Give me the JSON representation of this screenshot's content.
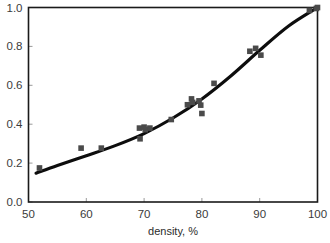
{
  "chart_data": {
    "type": "scatter",
    "title": "",
    "subtitle": "",
    "xlabel": "density, %",
    "ylabel": "",
    "xlim": [
      50,
      100
    ],
    "ylim": [
      0.0,
      1.0
    ],
    "xticks": [
      50,
      60,
      70,
      80,
      90,
      100
    ],
    "xtick_labels": [
      "50",
      "60",
      "70",
      "80",
      "90",
      "100"
    ],
    "yticks": [
      0.0,
      0.2,
      0.4,
      0.6,
      0.8,
      1.0
    ],
    "ytick_labels": [
      "0.0",
      "0.2",
      "0.4",
      "0.6",
      "0.8",
      "1.0"
    ],
    "grid": false,
    "legend": false,
    "legend_position": "none",
    "marker_style": "filled-square",
    "marker_color": "#4a4a4a",
    "line_color": "#0d0d0d",
    "frame_color": "#1a1a1a",
    "series": [
      {
        "name": "measured points",
        "type": "scatter",
        "points": [
          [
            51.9,
            0.175
          ],
          [
            59.1,
            0.277
          ],
          [
            62.6,
            0.277
          ],
          [
            69.2,
            0.38
          ],
          [
            69.3,
            0.325
          ],
          [
            70.0,
            0.385
          ],
          [
            70.2,
            0.372
          ],
          [
            71.0,
            0.38
          ],
          [
            74.7,
            0.424
          ],
          [
            77.5,
            0.5
          ],
          [
            78.2,
            0.53
          ],
          [
            78.4,
            0.512
          ],
          [
            79.5,
            0.52
          ],
          [
            79.8,
            0.498
          ],
          [
            80.0,
            0.455
          ],
          [
            82.1,
            0.61
          ],
          [
            88.3,
            0.775
          ],
          [
            89.3,
            0.79
          ],
          [
            90.2,
            0.755
          ],
          [
            98.6,
            0.985
          ],
          [
            99.8,
            0.995
          ],
          [
            100.0,
            1.0
          ]
        ]
      },
      {
        "name": "fitted curve",
        "type": "line",
        "points": [
          [
            51.3,
            0.148
          ],
          [
            55.0,
            0.188
          ],
          [
            60.0,
            0.238
          ],
          [
            65.0,
            0.29
          ],
          [
            70.0,
            0.352
          ],
          [
            75.0,
            0.432
          ],
          [
            80.0,
            0.53
          ],
          [
            85.0,
            0.648
          ],
          [
            90.0,
            0.78
          ],
          [
            95.0,
            0.905
          ],
          [
            100.0,
            1.0
          ]
        ]
      }
    ]
  },
  "axes": {
    "x_axis_name": "density-axis",
    "y_axis_name": "value-axis"
  }
}
